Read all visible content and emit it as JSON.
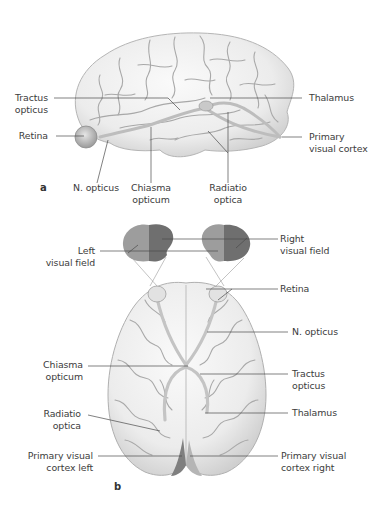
{
  "figure": {
    "panel_a": {
      "letter": "a",
      "view": "lateral view of brain",
      "labels": {
        "tractus_opticus": [
          "Tractus",
          "opticus"
        ],
        "retina": [
          "Retina"
        ],
        "n_opticus": [
          "N. opticus"
        ],
        "chiasma_opticum": [
          "Chiasma",
          "opticum"
        ],
        "radiatio_optica": [
          "Radiatio",
          "optica"
        ],
        "thalamus": [
          "Thalamus"
        ],
        "primary_visual_cortex": [
          "Primary",
          "visual cortex"
        ]
      }
    },
    "panel_b": {
      "letter": "b",
      "view": "inferior view of brain",
      "labels": {
        "left_visual_field": [
          "Left",
          "visual field"
        ],
        "right_visual_field": [
          "Right",
          "visual field"
        ],
        "retina": [
          "Retina"
        ],
        "n_opticus": [
          "N. opticus"
        ],
        "chiasma_opticum": [
          "Chiasma",
          "opticum"
        ],
        "tractus_opticus": [
          "Tractus",
          "opticus"
        ],
        "radiatio_optica": [
          "Radiatio",
          "optica"
        ],
        "thalamus": [
          "Thalamus"
        ],
        "primary_visual_cortex_left": [
          "Primary visual",
          "cortex left"
        ],
        "primary_visual_cortex_right": [
          "Primary visual",
          "cortex right"
        ]
      }
    },
    "colors": {
      "brain_fill": "#f1f1f1",
      "brain_shade": "#d9d9d9",
      "sulci": "#9c9c9c",
      "leader_line": "#4a4a4a",
      "visual_field_light": "#9a9a9a",
      "visual_field_dark": "#6e6e6e",
      "cortex_dark": "#7f7f7f"
    }
  }
}
